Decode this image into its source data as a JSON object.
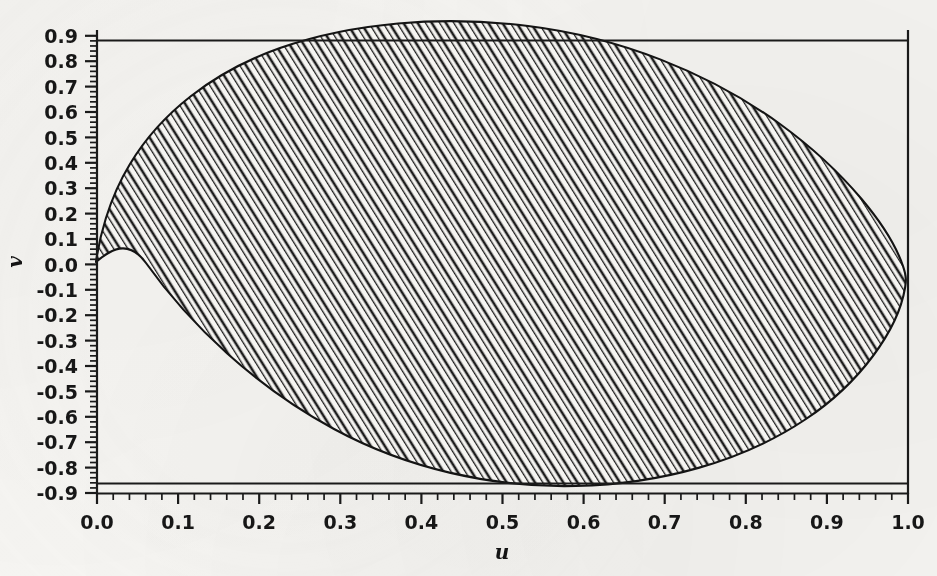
{
  "figure": {
    "background_color": "#f6f5f2",
    "ink_color": "#1a1a1a",
    "axis": {
      "x_label": "u",
      "y_label": "v",
      "x_ticks": [
        "0.0",
        "0.1",
        "0.2",
        "0.3",
        "0.4",
        "0.5",
        "0.6",
        "0.7",
        "0.8",
        "0.9",
        "1.0"
      ],
      "y_ticks": [
        "0.9",
        "0.8",
        "0.7",
        "0.6",
        "0.5",
        "0.4",
        "0.3",
        "0.2",
        "0.1",
        "0.0",
        "-0.1",
        "-0.2",
        "-0.3",
        "-0.4",
        "-0.5",
        "-0.6",
        "-0.7",
        "-0.8",
        "-0.9"
      ]
    }
  },
  "chart_data": {
    "type": "area",
    "title": "",
    "xlabel": "u",
    "ylabel": "v",
    "xlim": [
      0.0,
      1.0
    ],
    "ylim": [
      -0.9,
      0.9
    ],
    "x_ticks": [
      0.0,
      0.1,
      0.2,
      0.3,
      0.4,
      0.5,
      0.6,
      0.7,
      0.8,
      0.9,
      1.0
    ],
    "y_ticks": [
      -0.9,
      -0.8,
      -0.7,
      -0.6,
      -0.5,
      -0.4,
      -0.3,
      -0.2,
      -0.1,
      0.0,
      0.1,
      0.2,
      0.3,
      0.4,
      0.5,
      0.6,
      0.7,
      0.8,
      0.9
    ],
    "x_minor_tick_step": 0.02,
    "y_minor_tick_step": 0.02,
    "grid": false,
    "legend": null,
    "fill_style": "diagonal-hatch",
    "hatch_angle_deg": -32,
    "hatch_spacing_px": 6,
    "series": [
      {
        "name": "bounding-line-upper",
        "type": "line",
        "y_value": 0.87,
        "x_range": [
          0.0,
          1.0
        ]
      },
      {
        "name": "bounding-line-lower",
        "type": "line",
        "y_value": -0.87,
        "x_range": [
          0.0,
          1.0
        ]
      },
      {
        "name": "hatched-region-boundary",
        "type": "closed-curve",
        "description": "Teardrop / cardioid-like closed region with a cusp at the origin (0,0), widening to the right and touching u = 1.0",
        "cusp_point": [
          0.0,
          0.0
        ],
        "upper_boundary": {
          "u": [
            0.0,
            0.02,
            0.05,
            0.09,
            0.14,
            0.2,
            0.26,
            0.33,
            0.4,
            0.47,
            0.54,
            0.61,
            0.67,
            0.73,
            0.79,
            0.85,
            0.9,
            0.94,
            0.97,
            0.99,
            1.0
          ],
          "v": [
            0.0,
            0.13,
            0.25,
            0.36,
            0.46,
            0.56,
            0.64,
            0.71,
            0.77,
            0.81,
            0.845,
            0.862,
            0.868,
            0.866,
            0.855,
            0.832,
            0.795,
            0.74,
            0.66,
            0.56,
            0.43
          ]
        },
        "lower_boundary": {
          "u": [
            0.0,
            0.02,
            0.05,
            0.09,
            0.14,
            0.2,
            0.26,
            0.33,
            0.4,
            0.47,
            0.54,
            0.61,
            0.67,
            0.73,
            0.79,
            0.85,
            0.9,
            0.94,
            0.97,
            0.99,
            1.0
          ],
          "v": [
            0.0,
            -0.12,
            -0.23,
            -0.33,
            -0.43,
            -0.52,
            -0.6,
            -0.67,
            -0.73,
            -0.78,
            -0.815,
            -0.84,
            -0.852,
            -0.853,
            -0.845,
            -0.822,
            -0.788,
            -0.735,
            -0.66,
            -0.56,
            -0.43
          ]
        },
        "extent": {
          "u_min": 0.0,
          "u_max": 1.0,
          "v_min": -0.853,
          "v_max": 0.868
        }
      }
    ]
  }
}
